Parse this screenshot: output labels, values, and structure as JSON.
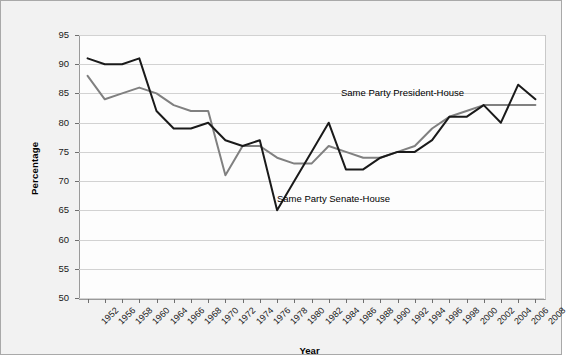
{
  "chart_data": {
    "type": "line",
    "title": "",
    "xlabel": "Year",
    "ylabel": "Percentage",
    "ylim": [
      50,
      95
    ],
    "yticks": [
      50,
      55,
      60,
      65,
      70,
      75,
      80,
      85,
      90,
      95
    ],
    "grid": true,
    "legend": "inline-annotations",
    "categories": [
      "1952",
      "1956",
      "1958",
      "1960",
      "1964",
      "1966",
      "1968",
      "1970",
      "1972",
      "1974",
      "1976",
      "1978",
      "1980",
      "1982",
      "1984",
      "1986",
      "1988",
      "1990",
      "1992",
      "1994",
      "1996",
      "1998",
      "2000",
      "2002",
      "2004",
      "2006",
      "2008"
    ],
    "series": [
      {
        "name": "Same Party Senate-House",
        "color": "#1a1a1a",
        "values": [
          91,
          90,
          90,
          91,
          82,
          79,
          79,
          80,
          77,
          76,
          77,
          65,
          70,
          75,
          80,
          72,
          72,
          74,
          75,
          75,
          77,
          81,
          81,
          83,
          80,
          86.5,
          84
        ]
      },
      {
        "name": "Same Party President-House",
        "color": "#808080",
        "values": [
          88,
          84,
          85,
          86,
          85,
          83,
          82,
          82,
          71,
          76,
          76,
          74,
          73,
          73,
          76,
          75,
          74,
          74,
          75,
          76,
          79,
          81,
          82,
          83,
          83,
          83,
          83
        ]
      }
    ],
    "annotations": [
      {
        "text": "Same Party President-House",
        "x_px": 340,
        "y_px": 87
      },
      {
        "text": "Same Party Senate-House",
        "x_px": 276,
        "y_px": 193
      }
    ]
  },
  "colors": {
    "series_senate_house": "#1a1a1a",
    "series_president_house": "#808080",
    "background": "#f2f2f2",
    "plot_background": "#fdfdfd",
    "gridline": "#d2d2d2",
    "axis": "#6f6f6f",
    "border": "#a9a9a9"
  }
}
